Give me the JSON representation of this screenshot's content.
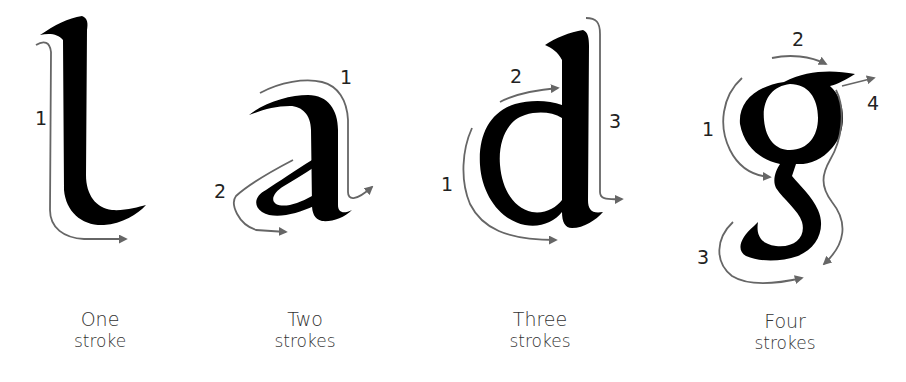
{
  "diagram": {
    "colors": {
      "ink": "#000000",
      "arrow": "#666666",
      "label": "#222222",
      "caption": "#333333"
    },
    "letters": [
      {
        "letter": "l",
        "caption_line1": "One",
        "caption_line2": "stroke",
        "stroke_labels": [
          "1"
        ]
      },
      {
        "letter": "a",
        "caption_line1": "Two",
        "caption_line2": "strokes",
        "stroke_labels": [
          "1",
          "2"
        ]
      },
      {
        "letter": "d",
        "caption_line1": "Three",
        "caption_line2": "strokes",
        "stroke_labels": [
          "1",
          "2",
          "3"
        ]
      },
      {
        "letter": "g",
        "caption_line1": "Four",
        "caption_line2": "strokes",
        "stroke_labels": [
          "1",
          "2",
          "3",
          "4"
        ]
      }
    ]
  }
}
